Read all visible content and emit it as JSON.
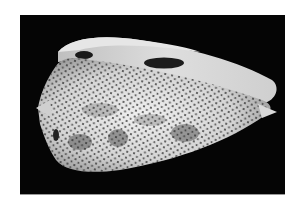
{
  "image": {
    "subject": "cone shell",
    "description": "Photograph of a cone snail shell on a black background, white with dense dark dots and brown blotches, aperture visible along the top",
    "colors": {
      "background": "#ffffff",
      "frame": "#050505",
      "shell_light": "#e8e8e8",
      "shell_mid": "#bdbdbd",
      "dots": "#2a2a2a"
    }
  }
}
